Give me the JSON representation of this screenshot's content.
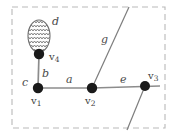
{
  "figure": {
    "border": {
      "style": "dashed",
      "color": "#b9b9b9",
      "x": 12,
      "y": 7,
      "width": 153,
      "height": 121
    },
    "colors": {
      "vertex": "#1a1a1a",
      "edge": "#8c8c8c",
      "edge_dark": "#6f6f6f",
      "label": "#4a4a4a",
      "border": "#b9b9b9",
      "loop_fill": "#fdfdfd",
      "loop_hatch": "#6e6e6e",
      "background": "#ffffff"
    },
    "vertices": [
      {
        "id": "v1",
        "label": "v",
        "sub": "1",
        "cx": 38,
        "cy": 88,
        "r": 5.2,
        "label_x": 30,
        "label_y": 97
      },
      {
        "id": "v2",
        "label": "v",
        "sub": "2",
        "cx": 92,
        "cy": 88,
        "r": 5.2,
        "label_x": 84,
        "label_y": 97
      },
      {
        "id": "v3",
        "label": "v",
        "sub": "3",
        "cx": 145,
        "cy": 86,
        "r": 5.0,
        "label_x": 147,
        "label_y": 72
      },
      {
        "id": "v4",
        "label": "v",
        "sub": "4",
        "cx": 39,
        "cy": 54,
        "r": 5.2,
        "label_x": 48,
        "label_y": 55
      }
    ],
    "edges": [
      {
        "id": "a",
        "label": "a",
        "kind": "line",
        "from": "v1",
        "to": "v2",
        "x1": 38,
        "y1": 88,
        "x2": 92,
        "y2": 88,
        "label_x": 66,
        "label_y": 74
      },
      {
        "id": "b",
        "label": "b",
        "kind": "line",
        "from": "v1",
        "to": "v4",
        "x1": 38,
        "y1": 88,
        "x2": 39,
        "y2": 54,
        "label_x": 42,
        "label_y": 68
      },
      {
        "id": "c",
        "label": "c",
        "kind": "label-only",
        "from": "v1",
        "to": "v4",
        "label_x": 22,
        "label_y": 77
      },
      {
        "id": "d",
        "label": "d",
        "kind": "loop",
        "from": "v4",
        "to": "v4",
        "cx": 39,
        "cy": 36,
        "rx": 11,
        "ry": 16,
        "label_x": 52,
        "label_y": 20
      },
      {
        "id": "e",
        "label": "e",
        "kind": "line",
        "from": "v2",
        "to": "v3",
        "x1": 92,
        "y1": 88,
        "x2": 145,
        "y2": 86,
        "label_x": 120,
        "label_y": 74
      },
      {
        "id": "g",
        "label": "g",
        "kind": "line",
        "from": "v2",
        "to": "boundary-top",
        "x1": 92,
        "y1": 88,
        "x2": 129,
        "y2": 7,
        "label_x": 101,
        "label_y": 36
      },
      {
        "id": "h",
        "label": "",
        "kind": "line",
        "from": "v3",
        "to": "boundary-bottom",
        "x1": 145,
        "y1": 86,
        "x2": 128,
        "y2": 128,
        "label_x": 0,
        "label_y": 0
      }
    ]
  }
}
